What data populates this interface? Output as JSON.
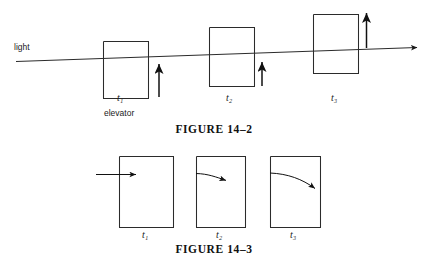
{
  "page": {
    "width": 428,
    "height": 274,
    "background": "#ffffff",
    "ink": "#1a1a1a"
  },
  "figure_14_2": {
    "caption": "FIGURE 14–2",
    "ray_label": "light",
    "annotation_label": "elevator",
    "frames": [
      {
        "label": "t",
        "subscript": "1",
        "label_text": "t₁"
      },
      {
        "label": "t",
        "subscript": "2",
        "label_text": "t₂"
      },
      {
        "label": "t",
        "subscript": "3",
        "label_text": "t₃"
      }
    ],
    "description": "Light ray crossing three successive positions of an upward-accelerating elevator",
    "icons": {
      "ray": "light-ray-arrow-icon",
      "motion": "upward-motion-arrow-icon",
      "box": "elevator-box-icon"
    }
  },
  "figure_14_3": {
    "caption": "FIGURE 14–3",
    "frames": [
      {
        "label_text": "t₁",
        "path": "straight-horizontal"
      },
      {
        "label_text": "t₂",
        "path": "slightly-curved-downward"
      },
      {
        "label_text": "t₃",
        "path": "strongly-curved-downward"
      }
    ],
    "description": "Light path inside the elevator appears to bend downward over successive times",
    "icons": {
      "beam": "light-beam-arrow-icon",
      "box": "elevator-box-icon"
    }
  }
}
